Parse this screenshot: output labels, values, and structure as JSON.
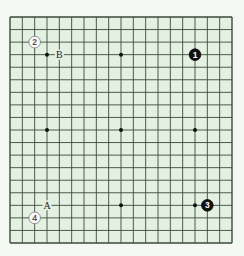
{
  "board": {
    "size": 19,
    "left": 10,
    "top": 17,
    "right": 232,
    "bottom": 243,
    "background": "#e4f1e2",
    "line_color": "#3b4a3c",
    "page_background": "#f3f8f2",
    "star_points": [
      [
        3,
        3
      ],
      [
        9,
        3
      ],
      [
        15,
        3
      ],
      [
        3,
        9
      ],
      [
        9,
        9
      ],
      [
        15,
        9
      ],
      [
        3,
        15
      ],
      [
        9,
        15
      ],
      [
        15,
        15
      ]
    ]
  },
  "stones": [
    {
      "color": "black",
      "number": "1",
      "col": 15,
      "row": 3
    },
    {
      "color": "white",
      "number": "2",
      "col": 2,
      "row": 2
    },
    {
      "color": "black",
      "number": "3",
      "col": 16,
      "row": 15
    },
    {
      "color": "white",
      "number": "4",
      "col": 2,
      "row": 16
    }
  ],
  "labels": [
    {
      "text": "B",
      "col": 4,
      "row": 3
    },
    {
      "text": "A",
      "col": 3,
      "row": 15
    }
  ]
}
